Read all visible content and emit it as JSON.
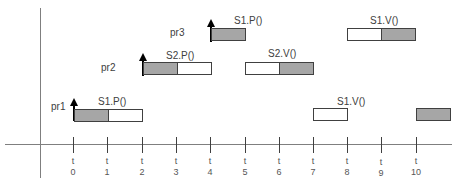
{
  "diagram": {
    "title": "",
    "time_axis": {
      "tick_prefix": "t",
      "ticks": [
        "0",
        "1",
        "2",
        "3",
        "4",
        "5",
        "6",
        "7",
        "8",
        "9",
        "10"
      ]
    },
    "processes": [
      {
        "name": "pr1"
      },
      {
        "name": "pr2"
      },
      {
        "name": "pr3"
      }
    ],
    "operations": [
      {
        "process": "pr1",
        "label": "S1.P()",
        "start": 0,
        "segments": [
          {
            "from": 0,
            "to": 1,
            "fill": "gray"
          },
          {
            "from": 1,
            "to": 2,
            "fill": "white"
          }
        ]
      },
      {
        "process": "pr1",
        "label": "S1.V()",
        "start": 7,
        "segments": [
          {
            "from": 7,
            "to": 8,
            "fill": "white"
          }
        ]
      },
      {
        "process": "pr1",
        "label": "",
        "start": 10,
        "segments": [
          {
            "from": 10,
            "to": 11,
            "fill": "gray"
          }
        ]
      },
      {
        "process": "pr2",
        "label": "S2.P()",
        "start": 2,
        "segments": [
          {
            "from": 2,
            "to": 3,
            "fill": "gray"
          },
          {
            "from": 3,
            "to": 4,
            "fill": "white"
          }
        ]
      },
      {
        "process": "pr2",
        "label": "S2.V()",
        "start": 5,
        "segments": [
          {
            "from": 5,
            "to": 6,
            "fill": "white"
          },
          {
            "from": 6,
            "to": 7,
            "fill": "gray"
          }
        ]
      },
      {
        "process": "pr3",
        "label": "S1.P()",
        "start": 4,
        "segments": [
          {
            "from": 4,
            "to": 5,
            "fill": "gray"
          }
        ]
      },
      {
        "process": "pr3",
        "label": "S1.V()",
        "start": 8,
        "segments": [
          {
            "from": 8,
            "to": 9,
            "fill": "white"
          },
          {
            "from": 9,
            "to": 10,
            "fill": "gray"
          }
        ]
      }
    ],
    "arrivals": [
      {
        "process": "pr1",
        "time": 0
      },
      {
        "process": "pr2",
        "time": 2
      },
      {
        "process": "pr3",
        "time": 4
      }
    ],
    "colors": {
      "gray_fill": "#a6a6a6",
      "white_fill": "#ffffff",
      "border": "#404040",
      "axis": "#7f7f7f"
    }
  }
}
